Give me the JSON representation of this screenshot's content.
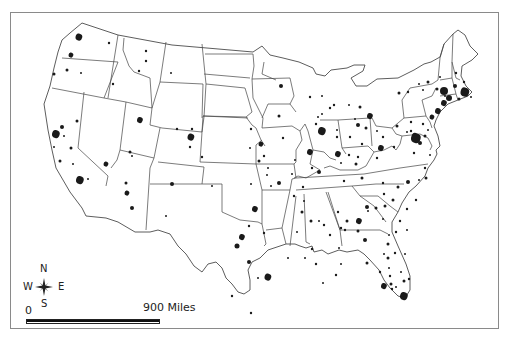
{
  "map": {
    "title": "",
    "subject": "Urbanized areas of the contiguous United States",
    "compass": {
      "n": "N",
      "s": "S",
      "e": "E",
      "w": "W",
      "icon": "compass-rose-icon"
    },
    "scale": {
      "start_label": "0",
      "end_label": "900 Miles"
    },
    "colors": {
      "frame": "#8a8a8a",
      "state_line": "#444444",
      "urban_fill": "#1a1a1a",
      "background": "#ffffff"
    },
    "urban_areas": [
      {
        "x": 79,
        "y": 37,
        "r": 3.5,
        "shape": "blob"
      },
      {
        "x": 71,
        "y": 55,
        "r": 2.5,
        "shape": "blob"
      },
      {
        "x": 54,
        "y": 74,
        "r": 1.5
      },
      {
        "x": 67,
        "y": 70,
        "r": 1.5
      },
      {
        "x": 81,
        "y": 73,
        "r": 1
      },
      {
        "x": 109,
        "y": 43,
        "r": 1.2
      },
      {
        "x": 113,
        "y": 84,
        "r": 1.2
      },
      {
        "x": 146,
        "y": 51,
        "r": 1.2
      },
      {
        "x": 146,
        "y": 61,
        "r": 1.2
      },
      {
        "x": 139,
        "y": 71,
        "r": 1.2
      },
      {
        "x": 171,
        "y": 73,
        "r": 1
      },
      {
        "x": 56,
        "y": 134,
        "r": 4,
        "shape": "blob"
      },
      {
        "x": 62,
        "y": 127,
        "r": 2
      },
      {
        "x": 64,
        "y": 136,
        "r": 1
      },
      {
        "x": 71,
        "y": 148,
        "r": 1.5
      },
      {
        "x": 54,
        "y": 147,
        "r": 1
      },
      {
        "x": 60,
        "y": 161,
        "r": 1.5
      },
      {
        "x": 73,
        "y": 164,
        "r": 1
      },
      {
        "x": 77,
        "y": 121,
        "r": 1.5
      },
      {
        "x": 106,
        "y": 164,
        "r": 2.5,
        "shape": "blob"
      },
      {
        "x": 80,
        "y": 180,
        "r": 4,
        "shape": "blob"
      },
      {
        "x": 88,
        "y": 179,
        "r": 1
      },
      {
        "x": 140,
        "y": 120,
        "r": 3,
        "shape": "blob"
      },
      {
        "x": 130,
        "y": 152,
        "r": 1.5
      },
      {
        "x": 132,
        "y": 156,
        "r": 1
      },
      {
        "x": 177,
        "y": 129,
        "r": 1.2
      },
      {
        "x": 192,
        "y": 129,
        "r": 1.2
      },
      {
        "x": 191,
        "y": 137,
        "r": 3.5,
        "shape": "blob"
      },
      {
        "x": 190,
        "y": 147,
        "r": 1.2
      },
      {
        "x": 202,
        "y": 157,
        "r": 1.2
      },
      {
        "x": 126,
        "y": 183,
        "r": 1.5
      },
      {
        "x": 127,
        "y": 193,
        "r": 2.5,
        "shape": "blob"
      },
      {
        "x": 132,
        "y": 208,
        "r": 2
      },
      {
        "x": 172,
        "y": 184,
        "r": 2
      },
      {
        "x": 166,
        "y": 216,
        "r": 1
      },
      {
        "x": 212,
        "y": 186,
        "r": 1
      },
      {
        "x": 251,
        "y": 184,
        "r": 1
      },
      {
        "x": 255,
        "y": 209,
        "r": 3,
        "shape": "blob"
      },
      {
        "x": 249,
        "y": 226,
        "r": 1.2
      },
      {
        "x": 242,
        "y": 237,
        "r": 3,
        "shape": "blob"
      },
      {
        "x": 237,
        "y": 246,
        "r": 2.5
      },
      {
        "x": 268,
        "y": 277,
        "r": 3.5,
        "shape": "blob"
      },
      {
        "x": 232,
        "y": 296,
        "r": 1.2
      },
      {
        "x": 251,
        "y": 129,
        "r": 1.2
      },
      {
        "x": 261,
        "y": 144,
        "r": 2.5,
        "shape": "blob"
      },
      {
        "x": 264,
        "y": 156,
        "r": 1.2
      },
      {
        "x": 259,
        "y": 161,
        "r": 1.5
      },
      {
        "x": 268,
        "y": 168,
        "r": 1
      },
      {
        "x": 281,
        "y": 86,
        "r": 2
      },
      {
        "x": 279,
        "y": 116,
        "r": 1.5
      },
      {
        "x": 250,
        "y": 148,
        "r": 1
      },
      {
        "x": 267,
        "y": 175,
        "r": 1
      },
      {
        "x": 271,
        "y": 186,
        "r": 1
      },
      {
        "x": 279,
        "y": 183,
        "r": 2
      },
      {
        "x": 310,
        "y": 97,
        "r": 1.2
      },
      {
        "x": 322,
        "y": 114,
        "r": 1
      },
      {
        "x": 316,
        "y": 124,
        "r": 1.2
      },
      {
        "x": 330,
        "y": 108,
        "r": 1.2
      },
      {
        "x": 283,
        "y": 138,
        "r": 1.2
      },
      {
        "x": 295,
        "y": 160,
        "r": 1
      },
      {
        "x": 264,
        "y": 233,
        "r": 1.2
      },
      {
        "x": 292,
        "y": 174,
        "r": 1
      },
      {
        "x": 294,
        "y": 196,
        "r": 1.2
      },
      {
        "x": 303,
        "y": 187,
        "r": 1.2
      },
      {
        "x": 310,
        "y": 152,
        "r": 3,
        "shape": "blob"
      },
      {
        "x": 319,
        "y": 172,
        "r": 2
      },
      {
        "x": 334,
        "y": 105,
        "r": 1.2
      },
      {
        "x": 318,
        "y": 117,
        "r": 1
      },
      {
        "x": 322,
        "y": 96,
        "r": 1
      },
      {
        "x": 322,
        "y": 131,
        "r": 4,
        "shape": "blob"
      },
      {
        "x": 312,
        "y": 168,
        "r": 1.2
      },
      {
        "x": 337,
        "y": 130,
        "r": 1
      },
      {
        "x": 349,
        "y": 105,
        "r": 1
      },
      {
        "x": 360,
        "y": 107,
        "r": 1.5
      },
      {
        "x": 355,
        "y": 119,
        "r": 1
      },
      {
        "x": 358,
        "y": 125,
        "r": 2
      },
      {
        "x": 370,
        "y": 116,
        "r": 3,
        "shape": "blob"
      },
      {
        "x": 349,
        "y": 155,
        "r": 1.2
      },
      {
        "x": 337,
        "y": 137,
        "r": 1.2
      },
      {
        "x": 350,
        "y": 137,
        "r": 1.2
      },
      {
        "x": 338,
        "y": 154,
        "r": 3,
        "shape": "blob"
      },
      {
        "x": 341,
        "y": 163,
        "r": 1
      },
      {
        "x": 356,
        "y": 164,
        "r": 1.5
      },
      {
        "x": 362,
        "y": 144,
        "r": 1.2
      },
      {
        "x": 358,
        "y": 157,
        "r": 1.2
      },
      {
        "x": 366,
        "y": 128,
        "r": 1.5
      },
      {
        "x": 377,
        "y": 131,
        "r": 1
      },
      {
        "x": 381,
        "y": 148,
        "r": 3,
        "shape": "blob"
      },
      {
        "x": 383,
        "y": 137,
        "r": 1.2
      },
      {
        "x": 377,
        "y": 158,
        "r": 1.2
      },
      {
        "x": 362,
        "y": 178,
        "r": 1.5
      },
      {
        "x": 344,
        "y": 181,
        "r": 1.2
      },
      {
        "x": 383,
        "y": 183,
        "r": 1.2
      },
      {
        "x": 398,
        "y": 187,
        "r": 1.5
      },
      {
        "x": 408,
        "y": 182,
        "r": 2
      },
      {
        "x": 384,
        "y": 194,
        "r": 1.2
      },
      {
        "x": 367,
        "y": 207,
        "r": 2
      },
      {
        "x": 376,
        "y": 208,
        "r": 1.5
      },
      {
        "x": 394,
        "y": 147,
        "r": 1.2
      },
      {
        "x": 414,
        "y": 153,
        "r": 1.2
      },
      {
        "x": 397,
        "y": 126,
        "r": 1.5
      },
      {
        "x": 411,
        "y": 122,
        "r": 1.2
      },
      {
        "x": 411,
        "y": 131,
        "r": 1.2
      },
      {
        "x": 423,
        "y": 124,
        "r": 1.2
      },
      {
        "x": 399,
        "y": 93,
        "r": 1.5
      },
      {
        "x": 408,
        "y": 92,
        "r": 1.2
      },
      {
        "x": 432,
        "y": 117,
        "r": 2.5,
        "shape": "blob"
      },
      {
        "x": 438,
        "y": 111,
        "r": 3,
        "shape": "blob"
      },
      {
        "x": 444,
        "y": 103,
        "r": 3,
        "shape": "blob"
      },
      {
        "x": 449,
        "y": 98,
        "r": 3
      },
      {
        "x": 407,
        "y": 132,
        "r": 1
      },
      {
        "x": 416,
        "y": 138,
        "r": 5,
        "shape": "blob"
      },
      {
        "x": 420,
        "y": 143,
        "r": 2
      },
      {
        "x": 425,
        "y": 136,
        "r": 1.5
      },
      {
        "x": 428,
        "y": 130,
        "r": 1
      },
      {
        "x": 430,
        "y": 155,
        "r": 1
      },
      {
        "x": 425,
        "y": 168,
        "r": 1.2
      },
      {
        "x": 426,
        "y": 178,
        "r": 1.5
      },
      {
        "x": 419,
        "y": 180,
        "r": 1
      },
      {
        "x": 416,
        "y": 200,
        "r": 1.2
      },
      {
        "x": 407,
        "y": 209,
        "r": 1.2
      },
      {
        "x": 428,
        "y": 82,
        "r": 1.5
      },
      {
        "x": 437,
        "y": 89,
        "r": 1.5
      },
      {
        "x": 455,
        "y": 86,
        "r": 2
      },
      {
        "x": 445,
        "y": 96,
        "r": 1
      },
      {
        "x": 444,
        "y": 91,
        "r": 4
      },
      {
        "x": 465,
        "y": 92,
        "r": 4.5,
        "shape": "blob"
      },
      {
        "x": 459,
        "y": 99,
        "r": 1.5
      },
      {
        "x": 471,
        "y": 97,
        "r": 1
      },
      {
        "x": 464,
        "y": 82,
        "r": 1.2
      },
      {
        "x": 456,
        "y": 73,
        "r": 1.2
      },
      {
        "x": 440,
        "y": 77,
        "r": 1
      },
      {
        "x": 423,
        "y": 90,
        "r": 1
      },
      {
        "x": 419,
        "y": 84,
        "r": 1
      },
      {
        "x": 341,
        "y": 228,
        "r": 1.2
      },
      {
        "x": 358,
        "y": 231,
        "r": 1.5
      },
      {
        "x": 368,
        "y": 211,
        "r": 1
      },
      {
        "x": 347,
        "y": 221,
        "r": 1.5
      },
      {
        "x": 359,
        "y": 221,
        "r": 3,
        "shape": "blob"
      },
      {
        "x": 365,
        "y": 240,
        "r": 2
      },
      {
        "x": 393,
        "y": 200,
        "r": 1.5
      },
      {
        "x": 319,
        "y": 221,
        "r": 1
      },
      {
        "x": 338,
        "y": 212,
        "r": 1.2
      },
      {
        "x": 312,
        "y": 249,
        "r": 1.2
      },
      {
        "x": 302,
        "y": 212,
        "r": 1.5
      },
      {
        "x": 324,
        "y": 225,
        "r": 1.2
      },
      {
        "x": 297,
        "y": 232,
        "r": 1
      },
      {
        "x": 305,
        "y": 258,
        "r": 1
      },
      {
        "x": 304,
        "y": 201,
        "r": 1
      },
      {
        "x": 311,
        "y": 221,
        "r": 1.5
      },
      {
        "x": 330,
        "y": 235,
        "r": 1.2
      },
      {
        "x": 385,
        "y": 206,
        "r": 1.5
      },
      {
        "x": 396,
        "y": 232,
        "r": 1.2
      },
      {
        "x": 400,
        "y": 221,
        "r": 1.2
      },
      {
        "x": 389,
        "y": 235,
        "r": 1
      },
      {
        "x": 388,
        "y": 244,
        "r": 1.5
      },
      {
        "x": 395,
        "y": 253,
        "r": 1.2
      },
      {
        "x": 407,
        "y": 230,
        "r": 1
      },
      {
        "x": 383,
        "y": 219,
        "r": 1
      },
      {
        "x": 336,
        "y": 275,
        "r": 1.2
      },
      {
        "x": 345,
        "y": 230,
        "r": 1.2
      },
      {
        "x": 339,
        "y": 248,
        "r": 1
      },
      {
        "x": 316,
        "y": 264,
        "r": 1.2
      },
      {
        "x": 341,
        "y": 264,
        "r": 1
      },
      {
        "x": 367,
        "y": 263,
        "r": 1.5
      },
      {
        "x": 388,
        "y": 258,
        "r": 1.5
      },
      {
        "x": 389,
        "y": 268,
        "r": 1
      },
      {
        "x": 380,
        "y": 272,
        "r": 1.2
      },
      {
        "x": 390,
        "y": 276,
        "r": 1.2
      },
      {
        "x": 391,
        "y": 284,
        "r": 1.5
      },
      {
        "x": 384,
        "y": 254,
        "r": 1
      },
      {
        "x": 401,
        "y": 272,
        "r": 1
      },
      {
        "x": 405,
        "y": 254,
        "r": 1
      },
      {
        "x": 384,
        "y": 286,
        "r": 3,
        "shape": "blob"
      },
      {
        "x": 392,
        "y": 289,
        "r": 1.2
      },
      {
        "x": 396,
        "y": 287,
        "r": 1
      },
      {
        "x": 404,
        "y": 296,
        "r": 4,
        "shape": "blob"
      },
      {
        "x": 404,
        "y": 281,
        "r": 1.5
      },
      {
        "x": 409,
        "y": 279,
        "r": 1.2
      },
      {
        "x": 249,
        "y": 262,
        "r": 2
      },
      {
        "x": 258,
        "y": 278,
        "r": 1
      },
      {
        "x": 323,
        "y": 283,
        "r": 1
      },
      {
        "x": 288,
        "y": 258,
        "r": 1
      },
      {
        "x": 251,
        "y": 313,
        "r": 1.2
      }
    ]
  }
}
